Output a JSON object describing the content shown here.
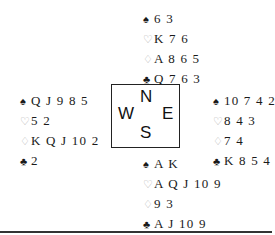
{
  "suits": {
    "spades": "♠",
    "hearts": "♡",
    "diamonds": "♢",
    "clubs": "♣"
  },
  "compass": {
    "north": "N",
    "west": "W",
    "east": "E",
    "south": "S"
  },
  "hands": {
    "north": {
      "spades": "6 3",
      "hearts": "K 7 6",
      "diamonds": "A 8 6 5",
      "clubs": "Q 7 6 3"
    },
    "west": {
      "spades": "Q J 9 8 5",
      "hearts": "5 2",
      "diamonds": "K Q J 10 2",
      "clubs": "2"
    },
    "east": {
      "spades": "10 7 4 2",
      "hearts": "8 4 3",
      "diamonds": "7 4",
      "clubs": "K 8 5 4"
    },
    "south": {
      "spades": "A K",
      "hearts": "A Q J 10 9",
      "diamonds": "9 3",
      "clubs": "A J 10 9"
    }
  },
  "colors": {
    "black_suit": "#1a1a1a",
    "red_suit_outline": "#b0b0b0",
    "border": "#222222"
  }
}
